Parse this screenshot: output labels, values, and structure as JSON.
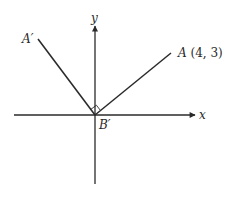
{
  "diagram": {
    "colors": {
      "stroke": "#2a2a2a",
      "background": "#ffffff"
    },
    "origin": {
      "px": [
        95,
        115
      ]
    },
    "axes": {
      "x": {
        "label": "x",
        "from": [
          14,
          115
        ],
        "to": [
          195,
          115
        ]
      },
      "y": {
        "label": "y",
        "from": [
          95,
          184
        ],
        "to": [
          95,
          26
        ]
      }
    },
    "segments": [
      {
        "name": "B'A'",
        "from": [
          95,
          115
        ],
        "to": [
          38,
          39
        ]
      },
      {
        "name": "B'A",
        "from": [
          95,
          115
        ],
        "to": [
          171,
          53
        ]
      }
    ],
    "right_angle_marker": {
      "at": "B'",
      "size": 7
    },
    "points": {
      "A_prime": {
        "label": "A′"
      },
      "A": {
        "label": "A",
        "coords": "(4, 3)"
      },
      "B_prime": {
        "label": "B′"
      }
    }
  }
}
